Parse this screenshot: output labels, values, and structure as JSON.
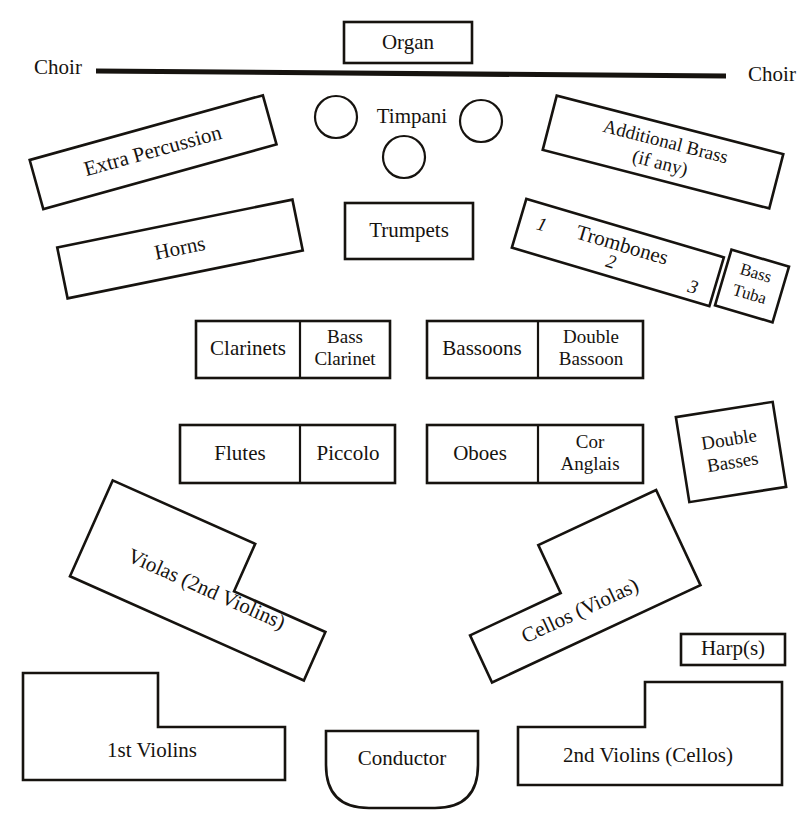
{
  "diagram": {
    "background_color": "#ffffff",
    "ink_color": "#16130f"
  },
  "labels": {
    "organ": "Organ",
    "choir_left": "Choir",
    "choir_right": "Choir",
    "timpani": "Timpani",
    "extra_percussion": "Extra Percussion",
    "horns": "Horns",
    "trumpets": "Trumpets",
    "additional_brass_line1": "Additional Brass",
    "additional_brass_line2": "(if any)",
    "trombones": "Trombones",
    "trombone_1": "1",
    "trombone_2": "2",
    "trombone_3": "3",
    "bass_tuba_line1": "Bass",
    "bass_tuba_line2": "Tuba",
    "clarinets": "Clarinets",
    "bass_clarinet_line1": "Bass",
    "bass_clarinet_line2": "Clarinet",
    "bassoons": "Bassoons",
    "double_bassoon_line1": "Double",
    "double_bassoon_line2": "Bassoon",
    "flutes": "Flutes",
    "piccolo": "Piccolo",
    "oboes": "Oboes",
    "cor_anglais_line1": "Cor",
    "cor_anglais_line2": "Anglais",
    "double_basses_line1": "Double",
    "double_basses_line2": "Basses",
    "violas": "Violas (2nd Violins)",
    "cellos": "Cellos (Violas)",
    "harps": "Harp(s)",
    "first_violins": "1st Violins",
    "conductor": "Conductor",
    "second_violins": "2nd Violins (Cellos)"
  },
  "sections": {
    "rear": [
      "Organ",
      "Choir",
      "Choir"
    ],
    "percussion": [
      "Timpani",
      "Extra Percussion"
    ],
    "brass": [
      "Horns",
      "Trumpets",
      "Additional Brass (if any)",
      "Trombones",
      "Bass Tuba"
    ],
    "woodwind": [
      "Clarinets",
      "Bass Clarinet",
      "Bassoons",
      "Double Bassoon",
      "Flutes",
      "Piccolo",
      "Oboes",
      "Cor Anglais"
    ],
    "strings": [
      "Double Basses",
      "Violas (2nd Violins)",
      "Cellos (Violas)",
      "Harp(s)",
      "1st Violins",
      "2nd Violins (Cellos)"
    ],
    "podium": [
      "Conductor"
    ]
  },
  "timpani_drums": {
    "count": 3,
    "note": "three circular drum outlines"
  }
}
